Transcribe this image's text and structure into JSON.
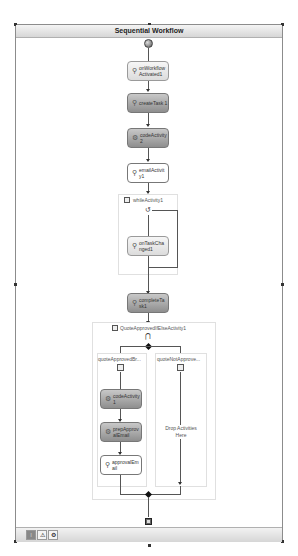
{
  "workflow": {
    "title": "Sequential Workflow",
    "activities": {
      "on_activated": "onWorkflow Activated1",
      "create_task": "createTask 1",
      "code_activity_2": "codeActivity 2",
      "email_activity": "emailActivit y1",
      "while": "whileActivity1",
      "on_task_changed": "onTaskCha nged1",
      "complete_task": "completeTa sk1",
      "ifelse": "QuoteApprovedIfElseActivity1",
      "branch_approved": "quoteApprovedBr...",
      "branch_not_approved": "quoteNotApprove...",
      "code_activity_1": "codeActivity 1",
      "prep_email": "prepApprov alEmail",
      "approval_email": "approvalEm ail",
      "drop_text": "Drop Activities Here"
    }
  },
  "bottom_tabs": [
    {
      "icon": "workflow-view-icon",
      "label": "⁞"
    },
    {
      "icon": "cancel-handler-icon",
      "label": "⚠"
    },
    {
      "icon": "fault-handler-icon",
      "label": "⚙"
    }
  ]
}
